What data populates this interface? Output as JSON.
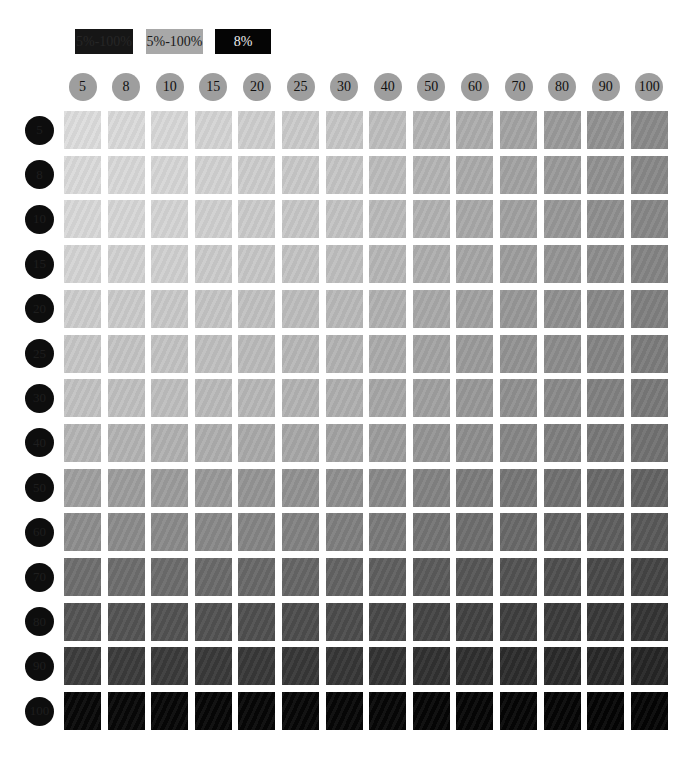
{
  "legend": [
    {
      "label": "5%-100%",
      "style": "dark",
      "color": "#161616"
    },
    {
      "label": "5%-100%",
      "style": "mid",
      "color": "#a8a8a8"
    },
    {
      "label": "8%",
      "style": "black",
      "color": "#050505"
    }
  ],
  "columns": [
    "5",
    "8",
    "10",
    "15",
    "20",
    "25",
    "30",
    "40",
    "50",
    "60",
    "70",
    "80",
    "90",
    "100"
  ],
  "rows": [
    "5",
    "8",
    "10",
    "15",
    "20",
    "25",
    "30",
    "40",
    "50",
    "60",
    "70",
    "80",
    "90",
    "100"
  ],
  "chart_data": {
    "type": "heatmap",
    "title": "",
    "legend": [
      "5%-100%",
      "5%-100%",
      "8%"
    ],
    "x": [
      5,
      8,
      10,
      15,
      20,
      25,
      30,
      40,
      50,
      60,
      70,
      80,
      90,
      100
    ],
    "y": [
      5,
      8,
      10,
      15,
      20,
      25,
      30,
      40,
      50,
      60,
      70,
      80,
      90,
      100
    ],
    "xlabel": "tint % (column)",
    "ylabel": "tint % (row)",
    "value_model": "cell gray darkens with both row % and column %; top-left ≈ #dcdcdc, top-right ≈ #8a8a8a, bottom row ≈ #050505",
    "corner_colors": {
      "top_left": "#dcdcdc",
      "top_right": "#8a8a8a",
      "bottom_left": "#060606",
      "bottom_right": "#030303"
    }
  }
}
